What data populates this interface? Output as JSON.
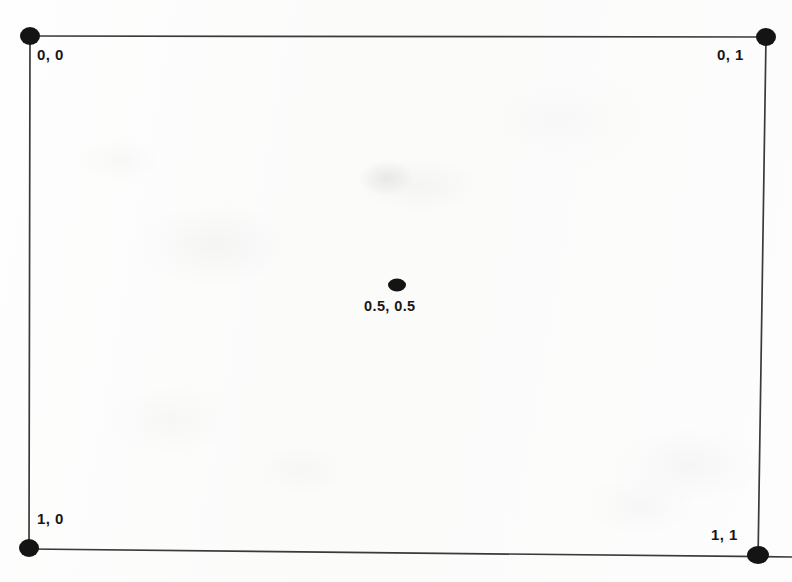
{
  "figure": {
    "type": "coordinate-space-diagram",
    "background_color": "#fdfdfc",
    "line_color": "#3a3a3a",
    "dot_color": "#141414",
    "text_color": "#171717"
  },
  "labels": {
    "top_left": "0, 0",
    "top_right": "0, 1",
    "bottom_left": "1, 0",
    "bottom_right": "1, 1",
    "center": "0.5, 0.5"
  },
  "points": [
    {
      "name": "top-left-corner",
      "label": "0, 0",
      "x": 30,
      "y": 36,
      "rx": 10,
      "ry": 9
    },
    {
      "name": "top-right-corner",
      "label": "0, 1",
      "x": 766,
      "y": 37,
      "rx": 10,
      "ry": 9
    },
    {
      "name": "bottom-left-corner",
      "label": "1, 0",
      "x": 29,
      "y": 548,
      "rx": 10,
      "ry": 9
    },
    {
      "name": "bottom-right-corner",
      "label": "1, 1",
      "x": 758,
      "y": 555,
      "rx": 11,
      "ry": 9
    },
    {
      "name": "center-point",
      "label": "0.5, 0.5",
      "x": 397,
      "y": 285,
      "rx": 9,
      "ry": 6.5
    }
  ],
  "edges": [
    {
      "name": "top-edge",
      "x1": 30,
      "y1": 36,
      "x2": 766,
      "y2": 37
    },
    {
      "name": "left-edge",
      "x1": 30,
      "y1": 36,
      "x2": 29,
      "y2": 548
    },
    {
      "name": "right-edge",
      "x1": 766,
      "y1": 37,
      "x2": 758,
      "y2": 560
    },
    {
      "name": "bottom-edge",
      "x1": 29,
      "y1": 548,
      "x2": 792,
      "y2": 556
    }
  ]
}
